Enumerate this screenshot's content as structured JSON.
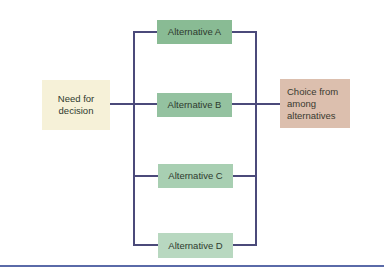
{
  "diagram": {
    "source": {
      "label": "Need for decision",
      "line1": "Need for",
      "line2": "decision",
      "color": "#f6f1d8"
    },
    "alternatives": [
      {
        "label": "Alternative A",
        "color": "#89bb94"
      },
      {
        "label": "Alternative B",
        "color": "#94c2a0"
      },
      {
        "label": "Alternative C",
        "color": "#a8cfb2"
      },
      {
        "label": "Alternative D",
        "color": "#b8d8c0"
      }
    ],
    "target": {
      "label": "Choice from among alternatives",
      "line1": "Choice from",
      "line2": "among",
      "line3": "alternatives",
      "color": "#dcbfae"
    },
    "connector_color": "#4b4a7a",
    "divider_color": "#5a6aa8"
  }
}
